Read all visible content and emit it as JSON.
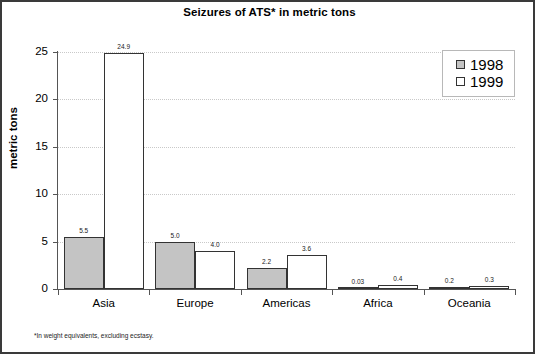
{
  "chart_data": {
    "type": "bar",
    "title": "Seizures of ATS* in metric tons",
    "xlabel": "",
    "ylabel": "metric tons",
    "ylim": [
      0,
      25
    ],
    "yticks": [
      0,
      5,
      10,
      15,
      20,
      25
    ],
    "grid": true,
    "legend_position": "top-right",
    "categories": [
      "Asia",
      "Europe",
      "Americas",
      "Africa",
      "Oceania"
    ],
    "series": [
      {
        "name": "1998",
        "color": "#c4c4c4",
        "values": [
          5.5,
          5.0,
          2.2,
          0.03,
          0.2
        ],
        "labels": [
          "5.5",
          "5.0",
          "2.2",
          "0.03",
          "0.2"
        ]
      },
      {
        "name": "1999",
        "color": "#ffffff",
        "values": [
          24.9,
          4.0,
          3.6,
          0.4,
          0.3
        ],
        "labels": [
          "24.9",
          "4.0",
          "3.6",
          "0.4",
          "0.3"
        ]
      }
    ],
    "footnote": "*In weight equivalents, excluding ecstasy."
  },
  "colors": {
    "series_1998": "#c4c4c4",
    "series_1999": "#ffffff",
    "bar_outline": "#333333",
    "axis": "#555555",
    "gridline": "#c9c9c9",
    "frame": "#3a3a3a",
    "text": "#000000"
  }
}
